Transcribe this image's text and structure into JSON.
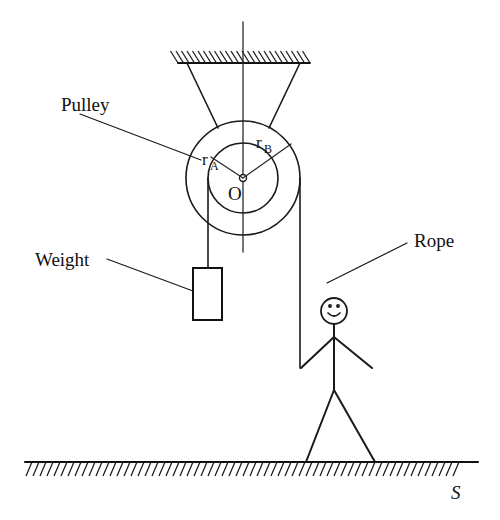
{
  "figure": {
    "type": "physics-free-body-diagram",
    "background_color": "#ffffff",
    "ink_color": "#1a1a1a"
  },
  "labels": {
    "pulley": "Pulley",
    "weight": "Weight",
    "rope": "Rope",
    "center": "O",
    "radius_inner_base": "r",
    "radius_inner_sub": "A",
    "radius_outer_base": "r",
    "radius_outer_sub": "B",
    "surface": "S"
  },
  "geometry": {
    "canvas": {
      "width": 500,
      "height": 520
    },
    "ceiling": {
      "x1": 178,
      "x2": 310,
      "y": 63,
      "hatch_side": "above",
      "hatch_count": 24
    },
    "ground": {
      "x1": 25,
      "x2": 478,
      "y": 462,
      "hatch_side": "below",
      "hatch_count": 62
    },
    "pulley": {
      "center_x": 243,
      "center_y": 178,
      "outer_radius": 57,
      "inner_radius": 35,
      "axle_radius": 3.5
    },
    "axis_line": {
      "x": 243,
      "y_top": 22,
      "y_bottom": 252
    },
    "supports": [
      {
        "x1": 187,
        "y1": 63,
        "x2": 217,
        "y2": 127
      },
      {
        "x1": 300,
        "y1": 63,
        "x2": 270,
        "y2": 127
      }
    ],
    "weight_rope": {
      "x": 208,
      "y_top": 178,
      "y_bottom": 268
    },
    "weight_box": {
      "x": 193,
      "y": 268,
      "width": 29,
      "height": 52
    },
    "pull_rope": {
      "x": 300,
      "y_top": 178,
      "y_bottom": 368
    },
    "person": {
      "head_center_x": 334,
      "head_center_y": 311,
      "head_radius": 13,
      "neck_y": 324,
      "shoulder_y": 337,
      "hip_y": 389,
      "left_hand_x": 302,
      "left_hand_y": 368,
      "right_hand_x": 372,
      "right_hand_y": 368,
      "left_foot_x": 306,
      "right_foot_x": 375,
      "foot_y": 462
    },
    "leaders": [
      {
        "name": "pulley-leader",
        "x1": 80,
        "y1": 113,
        "x2": 200,
        "y2": 159
      },
      {
        "name": "weight-leader",
        "x1": 107,
        "y1": 258,
        "x2": 193,
        "y2": 290
      },
      {
        "name": "rope-leader",
        "x1": 408,
        "y1": 243,
        "x2": 328,
        "y2": 283
      }
    ],
    "radius_arrows": [
      {
        "name": "r-A",
        "x1": 243,
        "y1": 178,
        "x2": 211,
        "y2": 158
      },
      {
        "name": "r-B",
        "x1": 243,
        "y1": 178,
        "x2": 290,
        "y2": 145
      }
    ],
    "label_positions": {
      "pulley": {
        "x": 61,
        "y": 110
      },
      "weight": {
        "x": 35,
        "y": 266
      },
      "rope": {
        "x": 415,
        "y": 246
      },
      "center": {
        "x": 229,
        "y": 199
      },
      "r_A": {
        "x": 203,
        "y": 163
      },
      "r_B": {
        "x": 257,
        "y": 146
      },
      "surface": {
        "x": 452,
        "y": 498
      }
    }
  }
}
